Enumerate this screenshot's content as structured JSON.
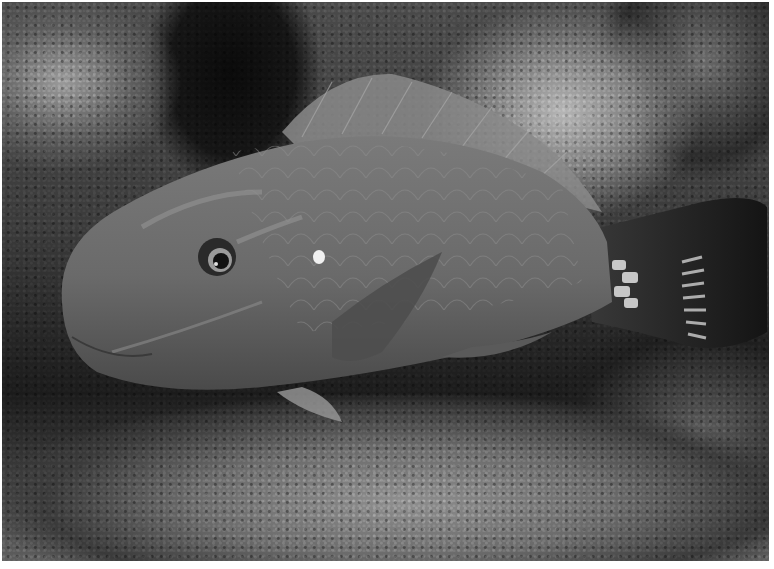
{
  "image": {
    "subject": "parrotfish resting on coral reef",
    "style": "black-and-white underwater photograph",
    "colors": {
      "fish_body": "#6e6e6e",
      "fish_belly": "#8a8a8a",
      "fish_scales": "#7c7c7c",
      "tail_dark": "#1c1c1c",
      "tail_spots": "#d8d8d8",
      "eye_ring": "#2a2a2a",
      "border": "#ffffff"
    }
  }
}
